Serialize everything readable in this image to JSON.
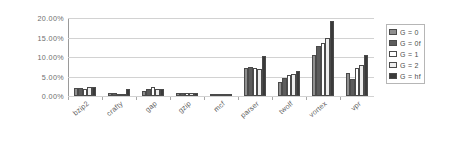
{
  "chart_data": {
    "type": "bar",
    "title": "",
    "xlabel": "",
    "ylabel": "",
    "ylim": [
      0,
      20
    ],
    "yticks": [
      0,
      5,
      10,
      15,
      20
    ],
    "ytick_labels": [
      "0.00%",
      "5.00%",
      "10.00%",
      "15.00%",
      "20.00%"
    ],
    "grid": true,
    "legend_position": "right",
    "categories": [
      "bzip2",
      "crafty",
      "gap",
      "gzip",
      "mcf",
      "parser",
      "twolf",
      "vortex",
      "vpr"
    ],
    "series": [
      {
        "name": "G = 0",
        "color": "#8f8f8f",
        "values": [
          2.1,
          0.9,
          1.3,
          0.9,
          0.0,
          7.1,
          3.6,
          10.5,
          5.8
        ]
      },
      {
        "name": "G = 0f",
        "color": "#5c5c5c",
        "values": [
          2.1,
          0.9,
          1.9,
          0.9,
          0.0,
          7.4,
          4.6,
          12.9,
          4.3
        ]
      },
      {
        "name": "G = 1",
        "color": "#ffffff",
        "values": [
          1.9,
          0.6,
          2.2,
          0.9,
          0.0,
          7.2,
          5.3,
          13.6,
          7.2
        ]
      },
      {
        "name": "G = 2",
        "color": "#ededed",
        "values": [
          2.2,
          0.4,
          1.9,
          0.9,
          0.0,
          6.9,
          5.7,
          14.9,
          7.9
        ]
      },
      {
        "name": "G = hf",
        "color": "#3a3a3a",
        "values": [
          2.3,
          1.8,
          1.7,
          0.9,
          0.0,
          10.3,
          6.4,
          19.2,
          10.4
        ]
      }
    ]
  },
  "legend": {
    "items": [
      {
        "label": "G = 0"
      },
      {
        "label": "G = 0f"
      },
      {
        "label": "G = 1"
      },
      {
        "label": "G = 2"
      },
      {
        "label": "G = hf"
      }
    ]
  }
}
